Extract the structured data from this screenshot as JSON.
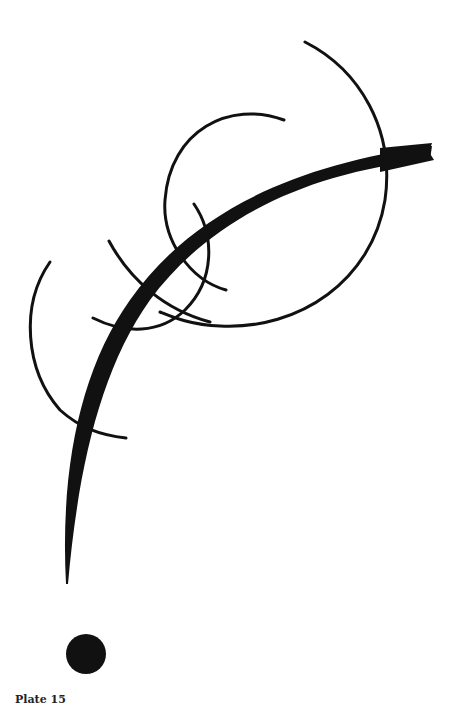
{
  "artwork": {
    "description": "Abstract line drawing: a thick sweeping curve crossed by thin arcs and circles, with a solid dot at bottom",
    "ink_color": "#111111",
    "background_color": "#ffffff"
  },
  "caption": {
    "label": "Plate 15"
  }
}
